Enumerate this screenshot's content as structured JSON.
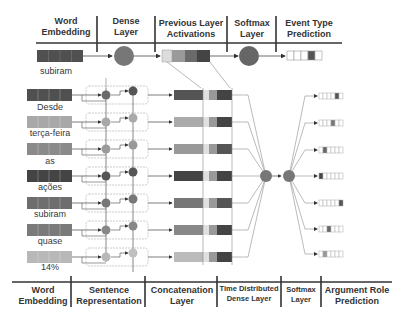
{
  "top_headers": [
    {
      "line1": "Word",
      "line2": "Embedding"
    },
    {
      "line1": "Dense",
      "line2": "Layer"
    },
    {
      "line1": "Previous Layer",
      "line2": "Activations"
    },
    {
      "line1": "Softmax",
      "line2": "Layer"
    },
    {
      "line1": "Event Type",
      "line2": "Prediction"
    }
  ],
  "bottom_headers": [
    {
      "line1": "Word",
      "line2": "Embedding"
    },
    {
      "line1": "Sentence",
      "line2": "Representation"
    },
    {
      "line1": "Concatenation",
      "line2": "Layer"
    },
    {
      "line1": "Time  Distributed",
      "line2": "Dense Layer"
    },
    {
      "line1": "Softmax",
      "line2": "Layer"
    },
    {
      "line1": "Argument Role",
      "line2": "Prediction"
    }
  ],
  "event_input_word": "subiram",
  "sentence_words": [
    "Desde",
    "terça-feira",
    "as",
    "ações",
    "subiram",
    "quase",
    "14%"
  ],
  "colors": {
    "line": "#444444",
    "header_rule": "#333333",
    "dark_cell": "#505050",
    "mid_cell": "#8a8a8a",
    "light_cell": "#b8b8b8",
    "node": "#7a7a7a",
    "dashed_box": "#aaaaaa"
  }
}
